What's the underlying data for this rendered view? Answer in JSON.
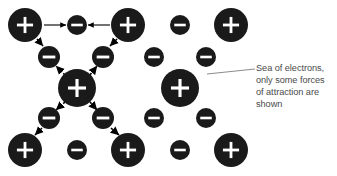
{
  "figure": {
    "type": "metallic-bonding-diagram",
    "title": "",
    "width": 337,
    "height": 176,
    "background_color": "#ffffff",
    "particle_fill_color": "#1a1a1a",
    "particle_symbol_color": "#ffffff",
    "arrow_color": "#000000",
    "leader_line_color": "#8c8c8c",
    "caption_color": "#4a4a4a"
  },
  "annotation": {
    "text": "Sea of electrons,\nonly some forces\nof attraction are\nshown",
    "lines": [
      "Sea of electrons,",
      "only some forces",
      "of attraction are",
      "shown"
    ],
    "leader_line": {
      "x1": 207,
      "y1": 74,
      "x2": 255,
      "y2": 69
    }
  },
  "particles": [
    {
      "id": "cation-r1c1",
      "charge": "+",
      "symbol": "+",
      "cx": 25,
      "cy": 25,
      "r": 17
    },
    {
      "id": "electron-r1c2",
      "charge": "-",
      "symbol": "–",
      "cx": 77,
      "cy": 25,
      "r": 10
    },
    {
      "id": "cation-r1c3",
      "charge": "+",
      "symbol": "+",
      "cx": 128,
      "cy": 25,
      "r": 17
    },
    {
      "id": "electron-r1c4",
      "charge": "-",
      "symbol": "–",
      "cx": 180,
      "cy": 25,
      "r": 10
    },
    {
      "id": "cation-r1c5",
      "charge": "+",
      "symbol": "+",
      "cx": 231,
      "cy": 25,
      "r": 17
    },
    {
      "id": "electron-r2c1",
      "charge": "-",
      "symbol": "–",
      "cx": 49,
      "cy": 57,
      "r": 11
    },
    {
      "id": "electron-r2c2",
      "charge": "-",
      "symbol": "–",
      "cx": 103,
      "cy": 57,
      "r": 11
    },
    {
      "id": "electron-r2c3",
      "charge": "-",
      "symbol": "–",
      "cx": 154,
      "cy": 57,
      "r": 10
    },
    {
      "id": "electron-r2c4",
      "charge": "-",
      "symbol": "–",
      "cx": 206,
      "cy": 57,
      "r": 10
    },
    {
      "id": "cation-r3c1",
      "charge": "+",
      "symbol": "+",
      "cx": 77,
      "cy": 88,
      "r": 19
    },
    {
      "id": "cation-r3c2",
      "charge": "+",
      "symbol": "+",
      "cx": 180,
      "cy": 88,
      "r": 19
    },
    {
      "id": "electron-r4c1",
      "charge": "-",
      "symbol": "–",
      "cx": 49,
      "cy": 118,
      "r": 11
    },
    {
      "id": "electron-r4c2",
      "charge": "-",
      "symbol": "–",
      "cx": 103,
      "cy": 118,
      "r": 11
    },
    {
      "id": "electron-r4c3",
      "charge": "-",
      "symbol": "–",
      "cx": 154,
      "cy": 118,
      "r": 10
    },
    {
      "id": "electron-r4c4",
      "charge": "-",
      "symbol": "–",
      "cx": 206,
      "cy": 118,
      "r": 10
    },
    {
      "id": "cation-r5c1",
      "charge": "+",
      "symbol": "+",
      "cx": 25,
      "cy": 150,
      "r": 17
    },
    {
      "id": "electron-r5c2",
      "charge": "-",
      "symbol": "–",
      "cx": 77,
      "cy": 150,
      "r": 10
    },
    {
      "id": "cation-r5c3",
      "charge": "+",
      "symbol": "+",
      "cx": 128,
      "cy": 150,
      "r": 17
    },
    {
      "id": "electron-r5c4",
      "charge": "-",
      "symbol": "–",
      "cx": 180,
      "cy": 150,
      "r": 10
    },
    {
      "id": "cation-r5c5",
      "charge": "+",
      "symbol": "+",
      "cx": 231,
      "cy": 150,
      "r": 17
    }
  ],
  "force_arrows": [
    {
      "id": "arrow-top-left",
      "style": "solid",
      "x1": 44,
      "y1": 25,
      "x2": 66,
      "y2": 25
    },
    {
      "id": "arrow-top-right",
      "style": "solid",
      "x1": 110,
      "y1": 25,
      "x2": 88,
      "y2": 25
    },
    {
      "id": "arrow-upleft-diag",
      "style": "dashed",
      "x1": 37,
      "y1": 39,
      "x2": 43,
      "y2": 46
    },
    {
      "id": "arrow-upright-diag",
      "style": "dashed",
      "x1": 117,
      "y1": 39,
      "x2": 110,
      "y2": 46
    },
    {
      "id": "arrow-center-upleft",
      "style": "dashed",
      "x1": 65,
      "y1": 75,
      "x2": 56,
      "y2": 66
    },
    {
      "id": "arrow-center-upright",
      "style": "dashed",
      "x1": 90,
      "y1": 75,
      "x2": 97,
      "y2": 66
    },
    {
      "id": "arrow-center-dnleft",
      "style": "dashed",
      "x1": 65,
      "y1": 102,
      "x2": 56,
      "y2": 110
    },
    {
      "id": "arrow-center-dnright",
      "style": "dashed",
      "x1": 90,
      "y1": 102,
      "x2": 97,
      "y2": 110
    },
    {
      "id": "arrow-lowleft-diag",
      "style": "dashed",
      "x1": 42,
      "y1": 128,
      "x2": 35,
      "y2": 135
    },
    {
      "id": "arrow-lowright-diag",
      "style": "dashed",
      "x1": 111,
      "y1": 128,
      "x2": 119,
      "y2": 135
    }
  ]
}
